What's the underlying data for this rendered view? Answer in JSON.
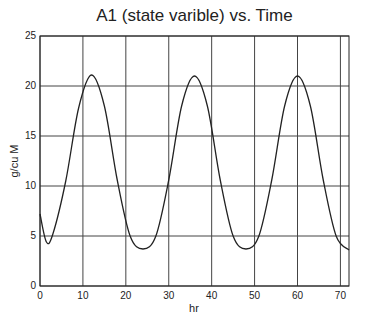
{
  "chart_data": {
    "type": "line",
    "title": "A1 (state varible) vs. Time",
    "xlabel": "hr",
    "ylabel": "g/cu M",
    "xlim": [
      0,
      72
    ],
    "ylim": [
      0,
      25
    ],
    "xticks": [
      0,
      10,
      20,
      30,
      40,
      50,
      60,
      70
    ],
    "yticks": [
      0,
      5,
      10,
      15,
      20,
      25
    ],
    "grid": true,
    "series": [
      {
        "name": "A1",
        "x": [
          0,
          1.5,
          3,
          6,
          9,
          12,
          15,
          18,
          21,
          24,
          27,
          30,
          33,
          36,
          39,
          42,
          45,
          48,
          51,
          54,
          57,
          60,
          63,
          66,
          69,
          72
        ],
        "values": [
          7.2,
          4.4,
          5.2,
          10.5,
          17.8,
          21.1,
          18.0,
          10.6,
          5.0,
          3.7,
          5.0,
          10.6,
          18.0,
          21.0,
          18.0,
          10.6,
          5.0,
          3.7,
          5.0,
          10.6,
          18.0,
          21.0,
          18.0,
          10.6,
          5.0,
          3.6
        ]
      }
    ]
  }
}
